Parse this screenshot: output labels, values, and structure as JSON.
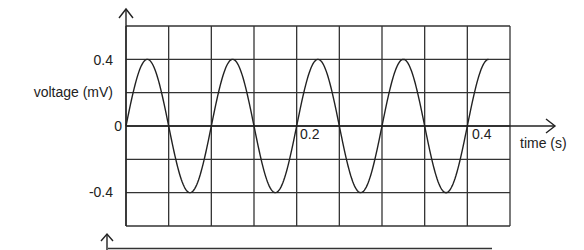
{
  "chart_data": {
    "type": "line",
    "title": "",
    "xlabel": "time (s)",
    "ylabel": "voltage (mV)",
    "xlim": [
      0,
      0.45
    ],
    "ylim": [
      -0.6,
      0.6
    ],
    "x_tick_labels": [
      {
        "value": 0.2,
        "label": "0.2"
      },
      {
        "value": 0.4,
        "label": "0.4"
      }
    ],
    "y_tick_labels": [
      {
        "value": 0.4,
        "label": "0.4"
      },
      {
        "value": 0,
        "label": "0"
      },
      {
        "value": -0.4,
        "label": "-0.4"
      }
    ],
    "grid": true,
    "grid_x_step": 0.05,
    "grid_y_step": 0.2,
    "series": [
      {
        "name": "voltage",
        "function": "0.4*sin(2*pi*10*t)",
        "amplitude": 0.4,
        "frequency_hz": 10,
        "period_s": 0.1,
        "t_start": 0,
        "t_end": 0.425,
        "x": [
          0,
          0.025,
          0.05,
          0.075,
          0.1,
          0.125,
          0.15,
          0.175,
          0.2,
          0.225,
          0.25,
          0.275,
          0.3,
          0.325,
          0.35,
          0.375,
          0.4,
          0.425
        ],
        "values": [
          0,
          0.4,
          0,
          -0.4,
          0,
          0.4,
          0,
          -0.4,
          0,
          0.4,
          0,
          -0.4,
          0,
          0.4,
          0,
          -0.4,
          0,
          0.4
        ]
      }
    ],
    "legend": null
  },
  "colors": {
    "line": "#222222",
    "grid": "#333333",
    "background": "#ffffff"
  }
}
